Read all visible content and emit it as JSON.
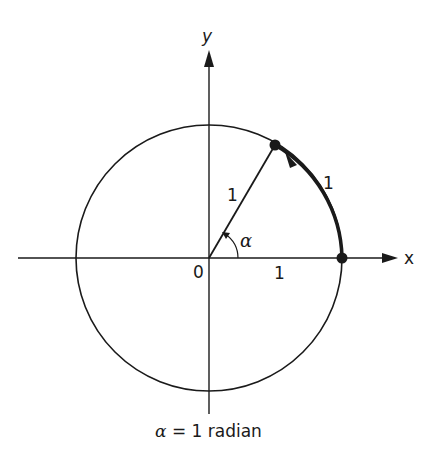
{
  "diagram": {
    "axes": {
      "x_label": "x",
      "y_label": "y",
      "origin_label": "0"
    },
    "labels": {
      "radius_label": "1",
      "arc_label": "1",
      "x_unit_label": "1",
      "angle_label": "α"
    },
    "caption": {
      "symbol": "α",
      "text": " = 1 radian"
    },
    "colors": {
      "stroke": "#1a1a1a",
      "background": "#ffffff"
    }
  }
}
